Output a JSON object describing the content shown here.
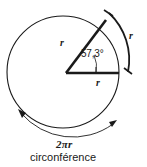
{
  "figure": {
    "stroke_color": "#1a1a1a",
    "background_color": "#ffffff"
  },
  "labels": {
    "radius_slant": "r",
    "radius_horizontal": "r",
    "arc_length": "r",
    "angle_value": "57,3°",
    "circumference_formula": "2πr",
    "caption": "circonférence"
  },
  "geometry": {
    "circle": {
      "cx": 63,
      "cy": 72,
      "r": 56
    },
    "center_point": {
      "x": 66,
      "y": 73
    },
    "radius_horizontal_end": {
      "x": 119,
      "y": 73
    },
    "radius_slant_end": {
      "x": 106,
      "y": 20
    },
    "angle_degrees": "57,3",
    "angle_arc_radius": 30,
    "outer_arc": {
      "start_x": 108,
      "start_y": 12,
      "end_x": 130,
      "end_y": 72
    },
    "circumference_arc": {
      "start_x": 18,
      "start_y": 112,
      "end_x": 116,
      "end_y": 124
    }
  }
}
